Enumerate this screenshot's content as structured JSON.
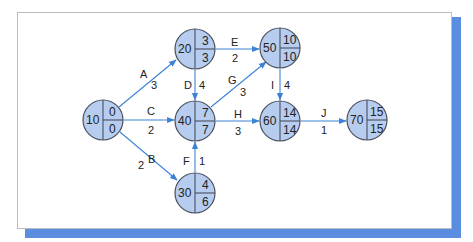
{
  "diagram": {
    "type": "activity-on-arrow network",
    "colors": {
      "node_fill": "#b7cdf0",
      "node_stroke": "#4a4f5c",
      "edge": "#3b82d6",
      "shadow": "#5b8ee0"
    },
    "nodes": [
      {
        "id": "10",
        "top": "0",
        "bottom": "0",
        "x": 103,
        "y": 120
      },
      {
        "id": "20",
        "top": "3",
        "bottom": "3",
        "x": 195,
        "y": 49
      },
      {
        "id": "40",
        "top": "7",
        "bottom": "7",
        "x": 195,
        "y": 121
      },
      {
        "id": "30",
        "top": "4",
        "bottom": "6",
        "x": 195,
        "y": 193
      },
      {
        "id": "50",
        "top": "10",
        "bottom": "10",
        "x": 280,
        "y": 48
      },
      {
        "id": "60",
        "top": "14",
        "bottom": "14",
        "x": 280,
        "y": 121
      },
      {
        "id": "70",
        "top": "15",
        "bottom": "15",
        "x": 367,
        "y": 120
      }
    ],
    "edges": [
      {
        "activity": "A",
        "duration": "3",
        "from": "10",
        "to": "20"
      },
      {
        "activity": "C",
        "duration": "2",
        "from": "10",
        "to": "40"
      },
      {
        "activity": "B",
        "duration": "2",
        "from": "10",
        "to": "30"
      },
      {
        "activity": "D",
        "duration": "4",
        "from": "20",
        "to": "40"
      },
      {
        "activity": "F",
        "duration": "1",
        "from": "30",
        "to": "40"
      },
      {
        "activity": "E",
        "duration": "2",
        "from": "20",
        "to": "50"
      },
      {
        "activity": "G",
        "duration": "3",
        "from": "40",
        "to": "50"
      },
      {
        "activity": "H",
        "duration": "3",
        "from": "40",
        "to": "60"
      },
      {
        "activity": "I",
        "duration": "4",
        "from": "50",
        "to": "60"
      },
      {
        "activity": "J",
        "duration": "1",
        "from": "60",
        "to": "70"
      }
    ]
  }
}
